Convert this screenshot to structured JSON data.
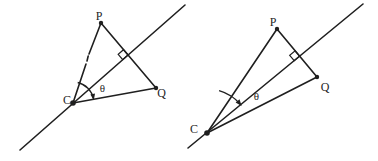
{
  "canvas": {
    "background": "#ffffff",
    "ink": "#1f1f1f"
  },
  "diagrams": {
    "left": {
      "labels": {
        "P": "P",
        "C": "C",
        "Q": "Q",
        "theta": "θ"
      }
    },
    "right": {
      "labels": {
        "P": "P",
        "C": "C",
        "Q": "Q",
        "theta": "θ"
      }
    }
  }
}
